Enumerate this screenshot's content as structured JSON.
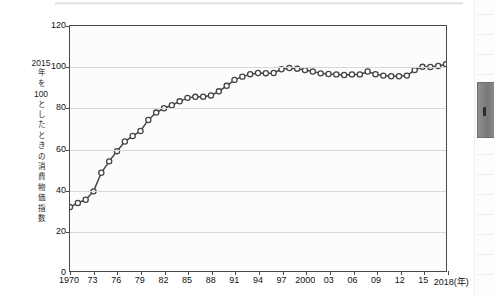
{
  "figure": {
    "y_axis_caption_lines": [
      "2015",
      "年",
      "を",
      "100",
      "と",
      "し",
      "た",
      "と",
      "き",
      "の",
      "消",
      "費",
      "物",
      "価",
      "指",
      "数"
    ],
    "x_axis_unit_label": "2018(年)"
  },
  "chart_data": {
    "type": "line",
    "title": "",
    "subtitle": "",
    "xlabel": "年",
    "ylabel": "2015年を100としたときの消費物価指数",
    "ylim": [
      0,
      120
    ],
    "yticks": [
      0,
      20,
      40,
      60,
      80,
      100,
      120
    ],
    "ytick_labels": [
      "0",
      "20",
      "40",
      "60",
      "80",
      "100",
      "120"
    ],
    "xlim": [
      1970,
      2018
    ],
    "xticks": [
      1970,
      1973,
      1976,
      1979,
      1982,
      1985,
      1988,
      1991,
      1994,
      1997,
      2000,
      2003,
      2006,
      2009,
      2012,
      2015,
      2018
    ],
    "xtick_labels": [
      "1970",
      "73",
      "76",
      "79",
      "82",
      "85",
      "88",
      "91",
      "94",
      "97",
      "2000",
      "03",
      "06",
      "09",
      "12",
      "15",
      "2018(年)"
    ],
    "grid": "horizontal",
    "legend": "none",
    "marker": "open-circle",
    "line_color": "#444444",
    "marker_face_color": "#ffffff",
    "x": [
      1970,
      1971,
      1972,
      1973,
      1974,
      1975,
      1976,
      1977,
      1978,
      1979,
      1980,
      1981,
      1982,
      1983,
      1984,
      1985,
      1986,
      1987,
      1988,
      1989,
      1990,
      1991,
      1992,
      1993,
      1994,
      1995,
      1996,
      1997,
      1998,
      1999,
      2000,
      2001,
      2002,
      2003,
      2004,
      2005,
      2006,
      2007,
      2008,
      2009,
      2010,
      2011,
      2012,
      2013,
      2014,
      2015,
      2016,
      2017,
      2018
    ],
    "values": [
      31.3,
      33.3,
      34.9,
      39.0,
      48.1,
      53.7,
      58.7,
      63.4,
      66.1,
      68.6,
      74.0,
      77.6,
      79.7,
      81.2,
      83.1,
      84.8,
      85.3,
      85.4,
      86.0,
      88.0,
      90.7,
      93.6,
      95.2,
      96.4,
      97.0,
      96.9,
      97.0,
      98.8,
      99.4,
      99.1,
      98.4,
      97.7,
      96.8,
      96.5,
      96.3,
      96.0,
      96.3,
      96.3,
      97.7,
      96.4,
      95.7,
      95.4,
      95.4,
      95.7,
      98.4,
      100.0,
      99.9,
      100.4,
      101.3
    ]
  }
}
